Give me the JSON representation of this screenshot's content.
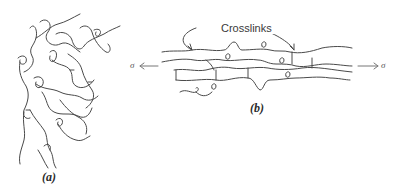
{
  "figure": {
    "panel_a": {
      "label": "(a)",
      "description": "Unstretched crosslinked polymer network (random coils)"
    },
    "panel_b": {
      "label": "(b)",
      "description": "Stretched crosslinked polymer chains under tensile stress",
      "callout": "Crosslinks",
      "stress_left": "σ",
      "stress_right": "σ"
    },
    "colors": {
      "line": "#4a4a4a",
      "text": "#2a2a2a",
      "background": "#ffffff"
    }
  }
}
